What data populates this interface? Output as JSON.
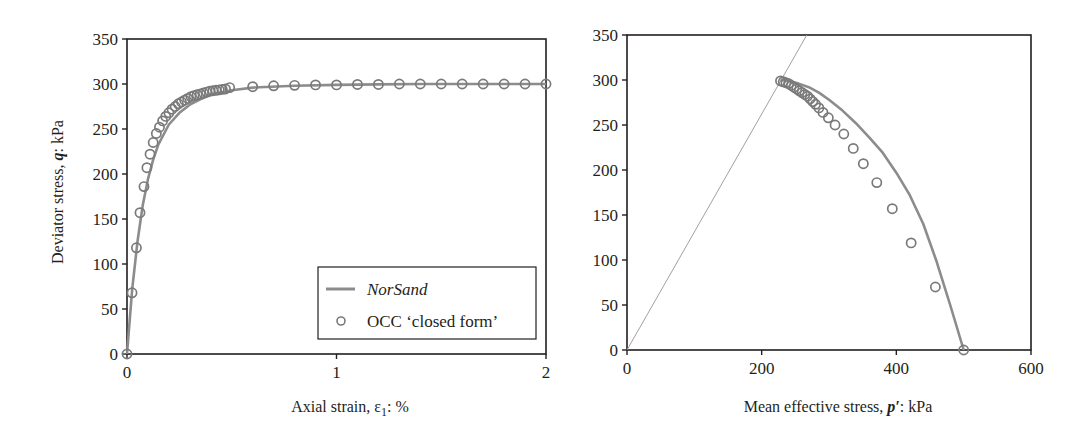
{
  "chart_data": [
    {
      "type": "line",
      "title": "",
      "xlabel": "Axial strain, ε1: %",
      "xlabel_parts": {
        "pre": "Axial strain, ε",
        "sub": "1",
        "post": ": %"
      },
      "ylabel": "Deviator stress, q: kPa",
      "ylabel_parts": {
        "pre": "Deviator stress, ",
        "ital": "q",
        "post": ": kPa"
      },
      "xlim": [
        0,
        2
      ],
      "ylim": [
        0,
        350
      ],
      "xticks": [
        0,
        1,
        2
      ],
      "yticks": [
        0,
        50,
        100,
        150,
        200,
        250,
        300,
        350
      ],
      "grid": false,
      "legend_position": "lower right",
      "legend": [
        "NorSand",
        "OCC ‘closed form’"
      ],
      "series": [
        {
          "name": "NorSand",
          "style": "line",
          "color": "#8c8c8c",
          "x": [
            0,
            0.025,
            0.05,
            0.075,
            0.1,
            0.125,
            0.15,
            0.2,
            0.25,
            0.3,
            0.35,
            0.4,
            0.5,
            0.6,
            0.8,
            1.0,
            1.2,
            1.4,
            1.6,
            1.8,
            2.0
          ],
          "y": [
            0,
            72,
            125,
            165,
            194,
            216,
            233,
            255,
            268,
            277,
            283,
            288,
            293,
            296,
            298,
            299,
            299.5,
            300,
            300,
            300,
            300
          ]
        },
        {
          "name": "OCC ‘closed form’",
          "style": "open-circle",
          "color": "#7a7a7a",
          "x": [
            0,
            0.024,
            0.045,
            0.062,
            0.081,
            0.095,
            0.11,
            0.125,
            0.14,
            0.155,
            0.17,
            0.185,
            0.2,
            0.215,
            0.23,
            0.245,
            0.26,
            0.275,
            0.29,
            0.305,
            0.32,
            0.335,
            0.35,
            0.365,
            0.38,
            0.395,
            0.41,
            0.425,
            0.44,
            0.455,
            0.47,
            0.49,
            0.6,
            0.7,
            0.8,
            0.9,
            1.0,
            1.1,
            1.2,
            1.3,
            1.4,
            1.5,
            1.6,
            1.7,
            1.8,
            1.9,
            2.0
          ],
          "y": [
            0,
            68,
            118,
            157,
            186,
            207,
            222,
            235,
            245,
            252,
            259,
            264,
            268,
            272,
            275,
            278,
            280,
            282,
            284,
            286,
            287,
            288,
            289,
            290,
            291,
            292,
            292.5,
            293,
            293.5,
            294,
            294.5,
            296,
            297,
            298,
            298.5,
            299,
            299,
            299.5,
            299.5,
            300,
            300,
            300,
            300,
            300,
            300,
            300,
            300
          ]
        }
      ]
    },
    {
      "type": "line",
      "title": "",
      "xlabel": "Mean effective stress, p': kPa",
      "xlabel_parts": {
        "pre": "Mean effective stress, ",
        "ital": "p′",
        "post": ": kPa"
      },
      "ylabel": "",
      "xlim": [
        0,
        600
      ],
      "ylim": [
        0,
        350
      ],
      "xticks": [
        0,
        200,
        400,
        600
      ],
      "yticks": [
        0,
        50,
        100,
        150,
        200,
        250,
        300,
        350
      ],
      "grid": false,
      "series": [
        {
          "name": "Critical state line",
          "style": "thin-line",
          "color": "#a0a0a0",
          "x": [
            0,
            267
          ],
          "y": [
            0,
            350
          ]
        },
        {
          "name": "NorSand",
          "style": "line",
          "color": "#8c8c8c",
          "x": [
            500,
            480,
            460,
            440,
            420,
            400,
            380,
            360,
            340,
            320,
            300,
            285,
            270,
            255,
            240,
            228
          ],
          "y": [
            0,
            50,
            98,
            140,
            172,
            197,
            219,
            236,
            252,
            266,
            278,
            286,
            292,
            296,
            299,
            300
          ]
        },
        {
          "name": "OCC ‘closed form’",
          "style": "open-circle",
          "color": "#7a7a7a",
          "x": [
            500,
            458,
            422,
            394,
            371,
            351,
            336,
            322,
            309,
            299,
            291,
            285,
            280,
            276,
            272,
            268,
            264,
            260,
            256,
            252,
            248,
            244,
            240,
            236,
            232,
            228
          ],
          "y": [
            0,
            70,
            119,
            157,
            186,
            207,
            224,
            240,
            250,
            258,
            264,
            269,
            273,
            276,
            279,
            282,
            284,
            286,
            288,
            290,
            292,
            294,
            296,
            297,
            298,
            299
          ]
        }
      ]
    }
  ]
}
